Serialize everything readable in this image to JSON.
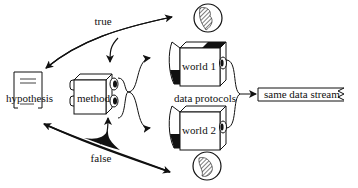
{
  "diagram": {
    "nodes": {
      "hypothesis": {
        "label": "hypothesis"
      },
      "method": {
        "label": "method"
      },
      "world1": {
        "label": "world 1"
      },
      "world2": {
        "label": "world 2"
      },
      "output": {
        "label": "same data stream"
      }
    },
    "edge_labels": {
      "true": "true",
      "false": "false",
      "data_protocols": "data protocols"
    },
    "edges": [
      {
        "from": "world1",
        "to": "hypothesis",
        "label": "true",
        "note": "branch also feeds method"
      },
      {
        "from": "world2",
        "to": "hypothesis",
        "label": "false",
        "note": "branch also feeds method"
      },
      {
        "from": "method",
        "to": "world1"
      },
      {
        "from": "method",
        "to": "world2"
      },
      {
        "from": "world1",
        "to": "output",
        "label": "data protocols"
      },
      {
        "from": "world2",
        "to": "output",
        "label": "data protocols"
      }
    ],
    "colors": {
      "ink": "#111111",
      "background": "#ffffff"
    }
  }
}
